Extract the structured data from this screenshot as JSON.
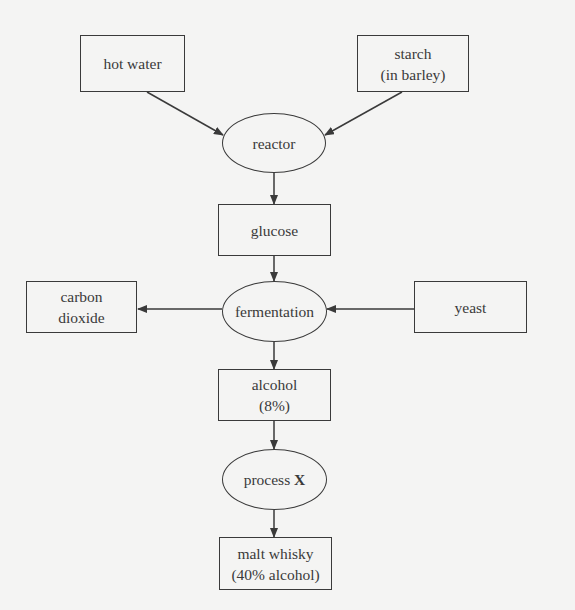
{
  "diagram": {
    "type": "flowchart",
    "colors": {
      "background": "#f4f4f3",
      "stroke": "#3a3a3a",
      "text": "#3a3a3a"
    },
    "nodes": {
      "hot_water": {
        "shape": "rectangle",
        "lines": [
          "hot water"
        ]
      },
      "starch": {
        "shape": "rectangle",
        "lines": [
          "starch",
          "(in barley)"
        ]
      },
      "reactor": {
        "shape": "ellipse",
        "lines": [
          "reactor"
        ]
      },
      "glucose": {
        "shape": "rectangle",
        "lines": [
          "glucose"
        ]
      },
      "carbon_dioxide": {
        "shape": "rectangle",
        "lines": [
          "carbon",
          "dioxide"
        ]
      },
      "fermentation": {
        "shape": "ellipse",
        "lines": [
          "fermentation"
        ]
      },
      "yeast": {
        "shape": "rectangle",
        "lines": [
          "yeast"
        ]
      },
      "alcohol": {
        "shape": "rectangle",
        "lines": [
          "alcohol",
          "(8%)"
        ]
      },
      "process_x": {
        "shape": "ellipse",
        "text": "process ",
        "bold_text": "X"
      },
      "malt_whisky": {
        "shape": "rectangle",
        "lines": [
          "malt whisky",
          "(40% alcohol)"
        ]
      }
    },
    "edges": [
      {
        "from": "hot_water",
        "to": "reactor"
      },
      {
        "from": "starch",
        "to": "reactor"
      },
      {
        "from": "reactor",
        "to": "glucose"
      },
      {
        "from": "glucose",
        "to": "fermentation"
      },
      {
        "from": "yeast",
        "to": "fermentation"
      },
      {
        "from": "fermentation",
        "to": "carbon_dioxide"
      },
      {
        "from": "fermentation",
        "to": "alcohol"
      },
      {
        "from": "alcohol",
        "to": "process_x"
      },
      {
        "from": "process_x",
        "to": "malt_whisky"
      }
    ]
  }
}
